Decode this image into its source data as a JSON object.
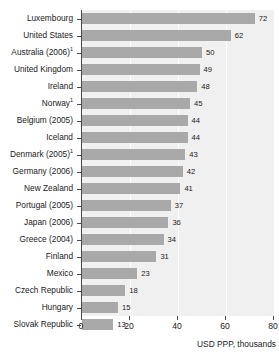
{
  "chart_data": {
    "type": "bar",
    "orientation": "horizontal",
    "title": "",
    "xlabel": "USD PPP, thousands",
    "ylabel": "",
    "xlim": [
      0,
      80
    ],
    "xticks": [
      0,
      20,
      40,
      60,
      80
    ],
    "grid": true,
    "legend": false,
    "bar_color": "#a9a9a9",
    "plot_background": "#f0f0f0",
    "gridline_color": "#ffffff",
    "axis_color": "#4a4a4a",
    "categories": [
      "Luxembourg",
      "United States",
      "Australia (2006)",
      "United Kingdom",
      "Ireland",
      "Norway",
      "Belgium (2005)",
      "Iceland",
      "Denmark (2005)",
      "Germany (2006)",
      "New Zealand",
      "Portugal (2005)",
      "Japan (2006)",
      "Greece (2004)",
      "Finland",
      "Mexico",
      "Czech Republic",
      "Hungary",
      "Slovak Republic"
    ],
    "footnote_markers": [
      "",
      "",
      "1",
      "",
      "",
      "1",
      "",
      "",
      "1",
      "",
      "",
      "",
      "",
      "",
      "",
      "",
      "",
      "",
      ""
    ],
    "values": [
      72,
      62,
      50,
      49,
      48,
      45,
      44,
      44,
      43,
      42,
      41,
      37,
      36,
      34,
      31,
      23,
      18,
      15,
      13
    ],
    "value_labels": [
      "72",
      "62",
      "50",
      "49",
      "48",
      "45",
      "44",
      "44",
      "43",
      "42",
      "41",
      "37",
      "36",
      "34",
      "31",
      "23",
      "18",
      "15",
      "13"
    ]
  }
}
